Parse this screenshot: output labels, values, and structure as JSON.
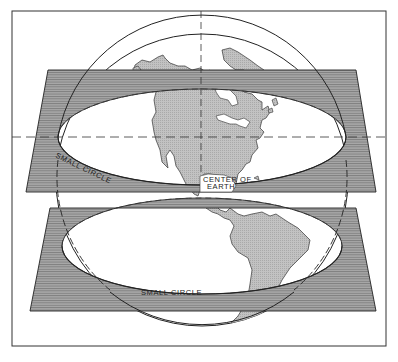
{
  "figure": {
    "type": "line-drawing",
    "colors": {
      "background": "#ffffff",
      "plane_fill": "#9a9a9a",
      "land_fill": "#b8b8b8",
      "line": "#222222"
    }
  },
  "labels": {
    "small_circle_upper": "SMALL CIRCLE",
    "small_circle_lower": "SMALL CIRCLE",
    "center_line1": "CENTER OF",
    "center_line2": "EARTH"
  },
  "captions": {
    "top": "e plane of the sphere pass...",
    "bottom": "...small circles are cut where the planes intersect the earth's surface..."
  }
}
